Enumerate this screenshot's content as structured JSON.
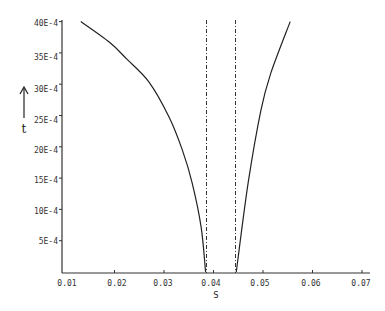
{
  "chart_data": {
    "type": "line",
    "title": "",
    "xlabel": "S",
    "ylabel": "t",
    "xlim": [
      0.01,
      0.07
    ],
    "ylim": [
      0,
      0.004
    ],
    "grid": false,
    "legend": null,
    "x_ticks": [
      "0.01",
      "0.02",
      "0.03",
      "0.04",
      "0.05",
      "0.06",
      "0.07"
    ],
    "y_ticks": [
      "5E-4",
      "10E-4",
      "15E-4",
      "20E-4",
      "25E-4",
      "30E-4",
      "35E-4",
      "40E-4"
    ],
    "series": [
      {
        "name": "left branch",
        "style": "solid",
        "x": [
          0.0132,
          0.019,
          0.0225,
          0.027,
          0.031,
          0.0337,
          0.0357,
          0.0375,
          0.0384
        ],
        "y": [
          0.004,
          0.00367,
          0.0034,
          0.00303,
          0.00248,
          0.00195,
          0.00142,
          0.00072,
          0.0
        ]
      },
      {
        "name": "right branch",
        "style": "solid",
        "x": [
          0.0446,
          0.047,
          0.0496,
          0.0516,
          0.0555
        ],
        "y": [
          0.0,
          0.00142,
          0.00259,
          0.00318,
          0.004
        ]
      }
    ],
    "annotations": [
      {
        "type": "vertical-dashed-line",
        "x": 0.0384,
        "label": ""
      },
      {
        "type": "vertical-dashed-line",
        "x": 0.0442,
        "label": ""
      }
    ],
    "ylabel_arrow": "up"
  },
  "axes": {
    "xlabel": "S",
    "ylabel": "t",
    "x_ticks": [
      "0.01",
      "0.02",
      "0.03",
      "0.04",
      "0.05",
      "0.06",
      "0.07"
    ],
    "y_ticks": [
      "5E-4",
      "10E-4",
      "15E-4",
      "20E-4",
      "25E-4",
      "30E-4",
      "35E-4",
      "40E-4"
    ]
  }
}
